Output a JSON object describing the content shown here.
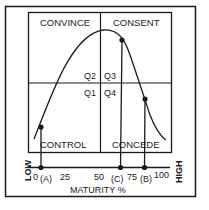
{
  "diagram": {
    "quadrants": {
      "top_left": "CONVINCE",
      "top_right": "CONSENT",
      "bottom_left": "CONTROL",
      "bottom_right": "CONCEDE"
    },
    "quadrant_codes": {
      "q1": "Q1",
      "q2": "Q2",
      "q3": "Q3",
      "q4": "Q4"
    },
    "x_axis": {
      "title": "MATURITY %",
      "low_label": "LOW",
      "high_label": "HIGH",
      "ticks": [
        "0",
        "25",
        "50",
        "75",
        "100"
      ],
      "markers": [
        "(A)",
        "(C)",
        "(B)"
      ]
    },
    "colors": {
      "line": "#1a1a1a",
      "background": "#ffffff"
    }
  }
}
